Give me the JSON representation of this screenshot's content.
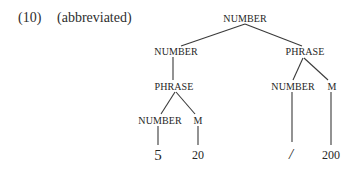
{
  "caption": {
    "number": "(10)",
    "note": "(abbreviated)"
  },
  "tree": {
    "root": {
      "label": "NUMBER"
    },
    "left": {
      "label": "NUMBER",
      "child": {
        "label": "PHRASE",
        "children": [
          {
            "label": "NUMBER",
            "leaf": "5"
          },
          {
            "label": "M",
            "leaf": "20"
          }
        ]
      }
    },
    "right": {
      "label": "PHRASE",
      "children": [
        {
          "label": "NUMBER",
          "leaf": "/"
        },
        {
          "label": "M",
          "leaf": "200"
        }
      ]
    }
  },
  "colors": {
    "text": "#262626",
    "lines": "#3a3a3a",
    "background": "#ffffff"
  }
}
